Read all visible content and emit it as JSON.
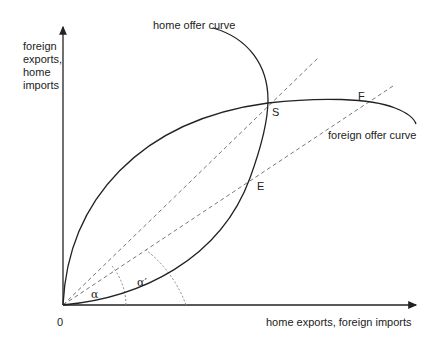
{
  "diagram": {
    "type": "offer-curve-diagram",
    "axes": {
      "y_label_lines": [
        "foreign",
        "exports,",
        "home",
        "imports"
      ],
      "x_label": "home exports, foreign imports",
      "origin_label": "0"
    },
    "curves": {
      "home": {
        "label": "home offer curve"
      },
      "foreign": {
        "label": "foreign offer curve"
      }
    },
    "points": {
      "S": "S",
      "E": "E",
      "F": "F"
    },
    "angles": {
      "alpha": "α",
      "alpha_prime": "α′"
    },
    "colors": {
      "curve": "#222222",
      "dashed": "#777777",
      "dotted": "#888888"
    }
  }
}
